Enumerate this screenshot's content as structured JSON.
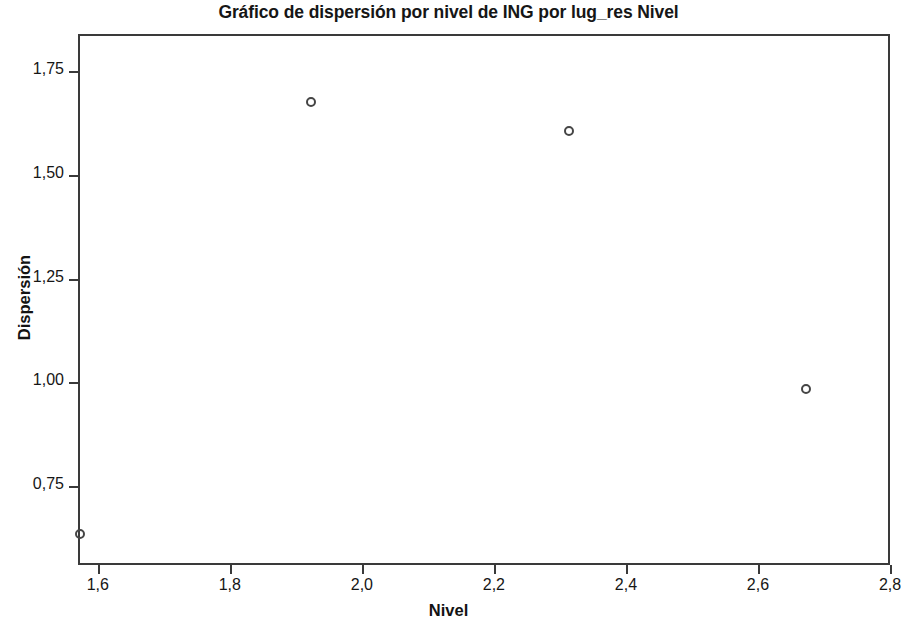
{
  "chart_data": {
    "type": "scatter",
    "title": "Gráfico de dispersión por nivel de ING por lug_res Nivel",
    "xlabel": "Nivel",
    "ylabel": "Dispersión",
    "xlim": [
      1.57,
      2.8
    ],
    "ylim": [
      0.56,
      1.84
    ],
    "grid": false,
    "legend": null,
    "xticks": [
      1.6,
      1.8,
      2.0,
      2.2,
      2.4,
      2.6,
      2.8
    ],
    "xticklabels": [
      "1,6",
      "1,8",
      "2,0",
      "2,2",
      "2,4",
      "2,6",
      "2,8"
    ],
    "yticks": [
      0.75,
      1.0,
      1.25,
      1.5,
      1.75
    ],
    "yticklabels": [
      "0,75",
      "1,00",
      "1,25",
      "1,50",
      "1,75"
    ],
    "marker": "open-circle",
    "marker_color": "#454545",
    "points": [
      {
        "x": 1.57,
        "y": 0.64
      },
      {
        "x": 1.92,
        "y": 1.68
      },
      {
        "x": 2.31,
        "y": 1.61
      },
      {
        "x": 2.67,
        "y": 0.99
      }
    ]
  }
}
